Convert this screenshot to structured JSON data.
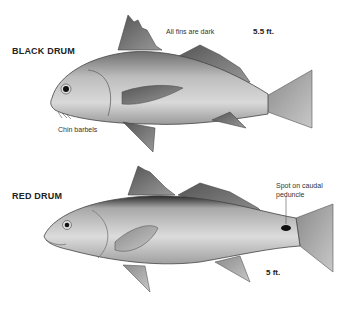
{
  "fish": [
    {
      "name": "BLACK DRUM",
      "size": "5.5 ft.",
      "annotations": [
        "All fins are dark",
        "Chin barbels"
      ]
    },
    {
      "name": "RED DRUM",
      "size": "5 ft.",
      "annotations": [
        "Spot on caudal peduncle"
      ],
      "annotation_lines": [
        "Spot on caudal",
        "peduncle"
      ]
    }
  ]
}
